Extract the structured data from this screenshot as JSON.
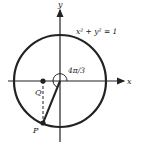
{
  "diagram": {
    "equation": "x² + y² = 1",
    "x_label": "x",
    "y_label": "y",
    "angle_label": "4π/3",
    "point_p": "P",
    "point_q": "Q",
    "stroke_color": "#222222"
  }
}
